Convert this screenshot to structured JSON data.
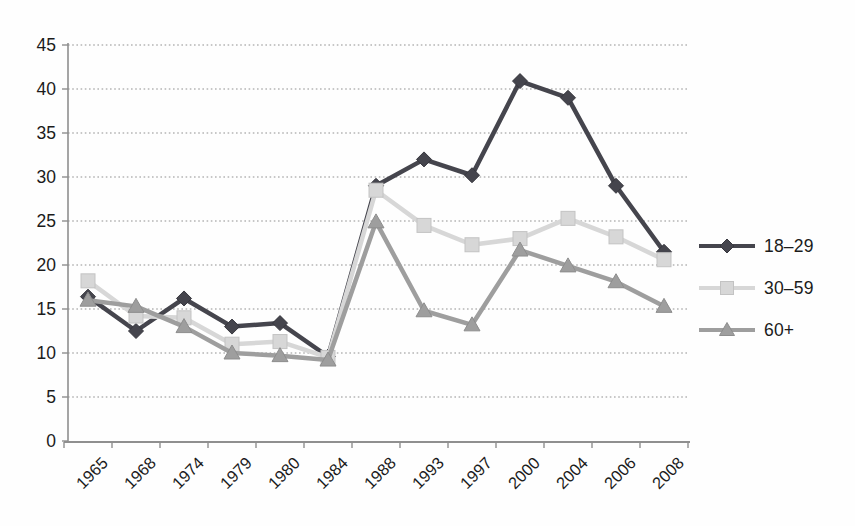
{
  "chart_data": {
    "type": "line",
    "categories": [
      "1965",
      "1968",
      "1974",
      "1979",
      "1980",
      "1984",
      "1988",
      "1993",
      "1997",
      "2000",
      "2004",
      "2006",
      "2008"
    ],
    "series": [
      {
        "name": "18–29",
        "marker": "diamond",
        "color": "#45454d",
        "edge": "#36363d",
        "values": [
          16.4,
          12.5,
          16.2,
          13.0,
          13.4,
          9.6,
          29.0,
          32.0,
          30.2,
          40.9,
          39.0,
          29.0,
          21.5
        ]
      },
      {
        "name": "30–59",
        "marker": "square",
        "color": "#d7d7d7",
        "edge": "#c3c3c3",
        "values": [
          18.2,
          14.2,
          14.0,
          11.0,
          11.3,
          9.5,
          28.5,
          24.5,
          22.3,
          23.0,
          25.3,
          23.2,
          20.6
        ]
      },
      {
        "name": "60+",
        "marker": "triangle",
        "color": "#9e9e9e",
        "edge": "#8d8d8d",
        "values": [
          16.0,
          15.3,
          13.0,
          10.0,
          9.7,
          9.2,
          24.9,
          14.8,
          13.2,
          21.7,
          19.9,
          18.1,
          15.3
        ]
      }
    ],
    "ylim": [
      0,
      45
    ],
    "ytick_step": 5,
    "yticks": [
      0,
      5,
      10,
      15,
      20,
      25,
      30,
      35,
      40,
      45
    ],
    "grid": "horizontal-dotted",
    "legend_position": "right",
    "x_label_rotation": -45
  },
  "colors": {
    "background": "#fefefe",
    "axis": "#8f8f8f",
    "gridline": "#b5b5b5",
    "text": "#1b1b1b"
  }
}
